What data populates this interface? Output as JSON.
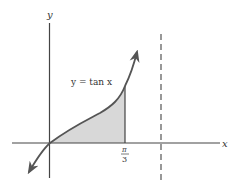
{
  "diagram": {
    "axes": {
      "x_label": "x",
      "y_label": "y"
    },
    "curve_label": "y = tan x",
    "tick": {
      "numerator": "π",
      "denominator": "3"
    },
    "shaded_region": {
      "from": "0",
      "to": "π/3",
      "color": "#d8d8d8"
    },
    "asymptote": {
      "style": "dashed",
      "at": "π/2"
    },
    "colors": {
      "stroke": "#444444",
      "fill": "#d8d8d8",
      "background": "#ffffff"
    }
  }
}
